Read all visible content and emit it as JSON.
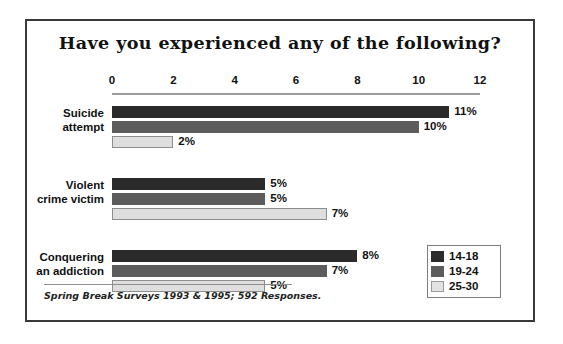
{
  "chart_data": {
    "type": "bar",
    "orientation": "horizontal",
    "title": "Have you experienced any of the following?",
    "categories": [
      "Suicide attempt",
      "Violent crime victim",
      "Conquering an addiction"
    ],
    "category_lines": [
      [
        "Suicide",
        "attempt"
      ],
      [
        "Violent",
        "crime victim"
      ],
      [
        "Conquering",
        "an addiction"
      ]
    ],
    "series": [
      {
        "name": "14-18",
        "color": "#2b2b2b",
        "values": [
          11,
          5,
          8
        ],
        "labels": [
          "11%",
          "5%",
          "8%"
        ]
      },
      {
        "name": "19-24",
        "color": "#5c5c5c",
        "values": [
          10,
          5,
          7
        ],
        "labels": [
          "10%",
          "5%",
          "7%"
        ]
      },
      {
        "name": "25-30",
        "color": "#dedede",
        "values": [
          2,
          7,
          5
        ],
        "labels": [
          "2%",
          "7%",
          "5%"
        ]
      }
    ],
    "xlabel": "",
    "ylabel": "",
    "xlim": [
      0,
      12
    ],
    "xticks": [
      0,
      2,
      4,
      6,
      8,
      10,
      12
    ],
    "xtick_labels": [
      "0",
      "2",
      "4",
      "6",
      "8",
      "10",
      "12"
    ],
    "grid": false,
    "legend_position": "bottom-right",
    "value_unit": "%"
  },
  "footnote": "Spring Break Surveys 1993 & 1995; 592 Responses.",
  "legend": {
    "items": [
      {
        "label": "14-18",
        "color": "#2b2b2b"
      },
      {
        "label": "19-24",
        "color": "#5c5c5c"
      },
      {
        "label": "25-30",
        "color": "#dedede"
      }
    ]
  }
}
